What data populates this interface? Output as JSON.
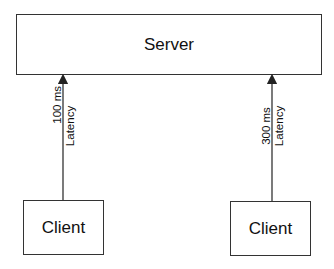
{
  "diagram": {
    "server": {
      "label": "Server"
    },
    "clients": [
      {
        "label": "Client",
        "latency_value": "100 ms",
        "latency_label": "Latency"
      },
      {
        "label": "Client",
        "latency_value": "300 ms",
        "latency_label": "Latency"
      }
    ],
    "colors": {
      "stroke": "#333333",
      "background": "#ffffff",
      "text": "#111111"
    }
  }
}
